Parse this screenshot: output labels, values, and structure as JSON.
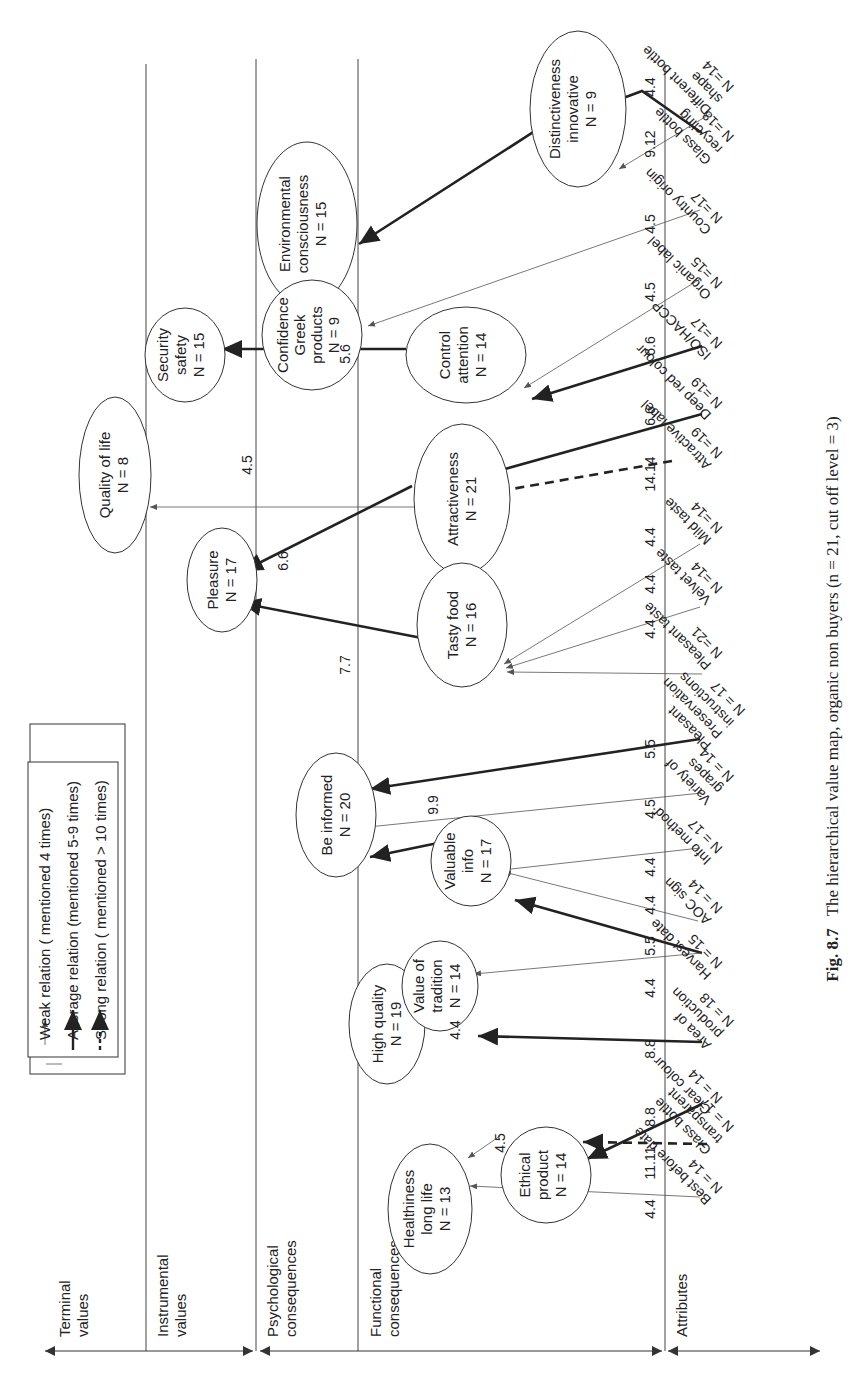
{
  "figure": {
    "caption_label": "Fig. 8.7",
    "caption_text": "The hierarchical value map, organic non buyers (n = 21, cut off level = 3)"
  },
  "legend": {
    "weak": "Weak relation ( mentioned 4 times)",
    "average": "Average relation (mentioned 5-9 times)",
    "strong": "Strong relation ( mentioned > 10 times)"
  },
  "levels": {
    "terminal": [
      "Terminal",
      "values"
    ],
    "instrumental": [
      "Instrumental",
      "values"
    ],
    "psychological": [
      "Psychological",
      "consequences"
    ],
    "functional": [
      "Functional",
      "consequences"
    ],
    "attributes": [
      "Attributes"
    ]
  },
  "nodes": {
    "quality_of_life": [
      "Quality of life",
      "N = 8"
    ],
    "security_safety": [
      "Security",
      "safety",
      "N = 15"
    ],
    "pleasure": [
      "Pleasure",
      "N = 17"
    ],
    "environmental": [
      "Environmental",
      "consciousness",
      "N = 15"
    ],
    "confidence": [
      "Confidence",
      "Greek",
      "products",
      "N = 9"
    ],
    "control_attention": [
      "Control",
      "attention",
      "N = 14"
    ],
    "attractiveness": [
      "Attractiveness",
      "N = 21"
    ],
    "tasty_food": [
      "Tasty food",
      "N = 16"
    ],
    "distinctiveness": [
      "Distinctiveness",
      "innovative",
      "N = 9"
    ],
    "be_informed": [
      "Be informed",
      "N = 20"
    ],
    "valuable_info": [
      "Valuable",
      "info",
      "N = 17"
    ],
    "high_quality": [
      "High quality",
      "N = 19"
    ],
    "value_of_tradition": [
      "Value of",
      "tradition",
      "N = 14"
    ],
    "healthiness": [
      "Healthiness",
      "long life",
      "N = 13"
    ],
    "ethical_product": [
      "Ethical",
      "product",
      "N = 14"
    ]
  },
  "attributes": {
    "different_bottle_shape": [
      "Different bottle",
      "shape",
      "N =14"
    ],
    "glass_bottle_recycling": [
      "Glass bottle",
      "recycling",
      "N =18"
    ],
    "country_origin": [
      "Country origin",
      "N =17"
    ],
    "organic_label": [
      "Organic label",
      "N =15"
    ],
    "iso_haccp": [
      "ISO/HACCP",
      "N =17"
    ],
    "deep_red_colour": [
      "Deep red colour",
      "N =19"
    ],
    "attractive_label": [
      "Attractive label",
      "N =19"
    ],
    "mild_taste": [
      "Mild taste",
      "N =14"
    ],
    "velvet_taste": [
      "Velvet taste",
      "N =14"
    ],
    "pleasant_taste": [
      "Pleasant taste",
      "N =21"
    ],
    "preservation_instructions": [
      "Pleasant",
      "Preservation",
      "instructions",
      "N = 17"
    ],
    "variety_of_grapes": [
      "Variety of",
      "grapes",
      "N = 14"
    ],
    "info_method": [
      "Info method",
      "N = 17"
    ],
    "aoc_sign": [
      "AOC sign",
      "N = 14"
    ],
    "harvest_date": [
      "Harvest date",
      "N = 15"
    ],
    "area_of_production": [
      "Area of",
      "production",
      "N = 18"
    ],
    "clear_colour": [
      "Clear colour",
      "N = 14"
    ],
    "glass_bottle_transparent": [
      "Glass bottle",
      "transparent",
      "N = 17"
    ],
    "best_before_date": [
      "Best before date",
      "N = 14"
    ]
  },
  "link_values": {
    "qol": "4.5",
    "security": "5.6",
    "pleasure_attr": "6.6",
    "pleasure_tasty": "7.7",
    "be_informed_valuable": "9.9",
    "high_quality": "4.4",
    "healthiness": "4.5",
    "dist": "4.4",
    "env": "9.12",
    "confidence": "4.5",
    "organic": "4.5",
    "iso": "6.6",
    "deep_red": "6.6",
    "attractive_label": "14.14",
    "mild": "4.4",
    "velvet": "4.4",
    "pleasant": "4.4",
    "preservation": "5.5",
    "variety": "4.5",
    "info_method": "4.4",
    "aoc": "4.4",
    "harvest_valuable": "5.5",
    "harvest_tradition": "4.4",
    "area": "8.8",
    "clear": "8.8",
    "glass_transparent": "11.11",
    "best_before": "4.4"
  }
}
